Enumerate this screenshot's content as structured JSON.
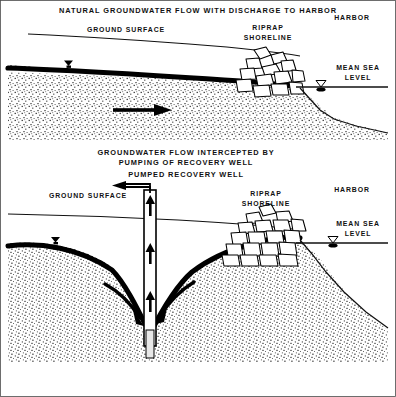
{
  "figure": {
    "kind": "engineering-cross-section-diagram",
    "border_color": "#4a4a4a",
    "ink_color": "#000000",
    "background": "#ffffff",
    "panels": [
      {
        "id": "panel-natural-flow",
        "title": "NATURAL GROUNDWATER FLOW WITH DISCHARGE TO HARBOR",
        "labels": {
          "ground_surface": "GROUND SURFACE",
          "riprap_shoreline_line1": "RIPRAP",
          "riprap_shoreline_line2": "SHORELINE",
          "harbor": "HARBOR",
          "mean_sea_level_line1": "MEAN SEA",
          "mean_sea_level_line2": "LEVEL"
        },
        "flow_arrow_direction": "right",
        "flow_arrow_count": 1
      },
      {
        "id": "panel-intercepted-flow",
        "title_line1": "GROUNDWATER FLOW INTERCEPTED BY",
        "title_line2": "PUMPING OF RECOVERY WELL",
        "title_line3": "PUMPED RECOVERY WELL",
        "labels": {
          "ground_surface": "GROUND SURFACE",
          "riprap_shoreline_line1": "RIPRAP",
          "riprap_shoreline_line2": "SHORELINE",
          "harbor": "HARBOR",
          "mean_sea_level_line1": "MEAN SEA",
          "mean_sea_level_line2": "LEVEL"
        },
        "well": {
          "type": "pumped-recovery-well",
          "riser_flow_direction": "up",
          "riser_arrow_count": 3,
          "discharge_direction": "left"
        },
        "capture_arrows": {
          "left_count": 1,
          "right_count": 1,
          "direction": "converging-to-well"
        },
        "water_table_shape": "cone-of-depression"
      }
    ]
  }
}
